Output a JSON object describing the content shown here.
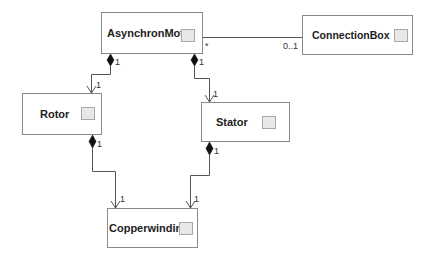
{
  "diagram": {
    "type": "UML class diagram",
    "classes": [
      {
        "id": "asynchronmotor",
        "name": "AsynchronMotor"
      },
      {
        "id": "connectionbox",
        "name": "ConnectionBox"
      },
      {
        "id": "rotor",
        "name": "Rotor"
      },
      {
        "id": "stator",
        "name": "Stator"
      },
      {
        "id": "copperwinding",
        "name": "Copperwinding"
      }
    ],
    "relations": [
      {
        "from": "AsynchronMotor",
        "to": "ConnectionBox",
        "kind": "association",
        "from_mult": "*",
        "to_mult": "0..1"
      },
      {
        "from": "AsynchronMotor",
        "to": "Rotor",
        "kind": "composition",
        "from_mult": "1",
        "to_mult": "1"
      },
      {
        "from": "AsynchronMotor",
        "to": "Stator",
        "kind": "composition",
        "from_mult": "1",
        "to_mult": "1"
      },
      {
        "from": "Rotor",
        "to": "Copperwinding",
        "kind": "composition",
        "from_mult": "1",
        "to_mult": "1"
      },
      {
        "from": "Stator",
        "to": "Copperwinding",
        "kind": "composition",
        "from_mult": "1",
        "to_mult": "1"
      }
    ]
  },
  "colors": {
    "line": "#555555",
    "border": "#8a8a8a",
    "icon_fill": "#e8e8e8"
  }
}
